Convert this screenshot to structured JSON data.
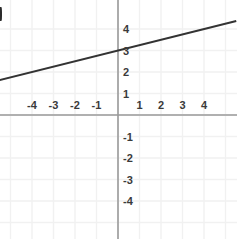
{
  "chart_data": {
    "type": "line",
    "title": "",
    "subtitle": "",
    "xlabel": "",
    "ylabel": "",
    "xlim": [
      -5.5,
      5.5
    ],
    "ylim": [
      -5.7,
      4.7
    ],
    "xticks": [
      -4,
      -3,
      -2,
      -1,
      1,
      2,
      3,
      4
    ],
    "yticks": [
      4,
      3,
      2,
      1,
      -1,
      -2,
      -3,
      -4
    ],
    "xtick_labels": [
      "-4",
      "-3",
      "-2",
      "-1",
      "1",
      "2",
      "3",
      "4"
    ],
    "ytick_labels": [
      "4",
      "3",
      "2",
      "1",
      "-1",
      "-2",
      "-3",
      "-4"
    ],
    "grid": true,
    "grid_spacing": 1,
    "legend": null,
    "legend_position": "none",
    "annotations": [],
    "series": [
      {
        "name": "line",
        "type": "line",
        "slope": 0.25,
        "intercept": 3,
        "equation": "y = 0.25x + 3",
        "x": [
          -5.5,
          5.5
        ],
        "y": [
          1.625,
          4.375
        ],
        "points": [
          {
            "x": -4,
            "y": 2
          },
          {
            "x": 0,
            "y": 3
          },
          {
            "x": 4,
            "y": 4
          }
        ]
      }
    ]
  },
  "graph": {
    "origin_label": "",
    "x_axis_name": "x-axis",
    "y_axis_name": "y-axis",
    "line_name": "plotted-line"
  },
  "colors": {
    "background": "#ffffff",
    "grid": "#f1f1f1",
    "axis": "#9a9a9a",
    "line": "#333333",
    "tick_text": "#3a3a3a",
    "edge_artifact": "#2b2b2b"
  },
  "geometry": {
    "width": 237,
    "height": 239,
    "origin_x": 118,
    "origin_y": 115,
    "unit_x": 21.5,
    "unit_y": 21.5
  }
}
